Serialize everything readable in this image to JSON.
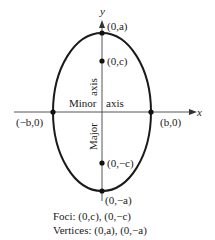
{
  "diagram": {
    "type": "ellipse-vertical-major-axis",
    "axes": {
      "x_label": "x",
      "y_label": "y"
    },
    "points": {
      "top_vertex": "(0,a)",
      "bottom_vertex": "(0,−a)",
      "focus_top": "(0,c)",
      "focus_bottom": "(0,−c)",
      "left_covertex": "(−b,0)",
      "right_covertex": "(b,0)"
    },
    "axis_labels": {
      "major_word": "Major",
      "major_axis_word": "axis",
      "minor_word": "Minor",
      "minor_axis_word": "axis"
    },
    "colors": {
      "stroke": "#1a1a1a",
      "axis": "#555555",
      "background": "#ffffff"
    }
  },
  "caption": {
    "foci": "Foci: (0,c), (0,−c)",
    "vertices": "Vertices: (0,a), (0,−a)"
  }
}
